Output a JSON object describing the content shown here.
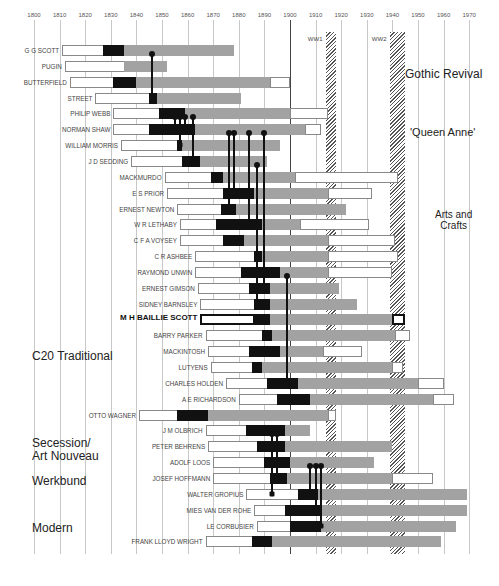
{
  "chart_data": {
    "type": "timeline-gantt",
    "title": "",
    "x_axis": {
      "label": "",
      "ticks": [
        1800,
        1810,
        1820,
        1830,
        1840,
        1850,
        1860,
        1870,
        1880,
        1890,
        1900,
        1910,
        1920,
        1930,
        1940,
        1950,
        1960,
        1970
      ],
      "range": [
        1800,
        1975
      ]
    },
    "legend": {
      "white": "early life / training",
      "black": "key formative period",
      "gray": "active career",
      "white_tail": "later life"
    },
    "wars": [
      {
        "label": "WW1",
        "start": 1914,
        "end": 1918
      },
      {
        "label": "WW2",
        "start": 1939,
        "end": 1945
      }
    ],
    "movements": [
      {
        "label": "Gothic Revival",
        "x": 405,
        "y": 68,
        "size": 12
      },
      {
        "label": "'Queen Anne'",
        "x": 410,
        "y": 126,
        "size": 11
      },
      {
        "label": "Arts and\nCrafts",
        "x": 435,
        "y": 209,
        "size": 10,
        "align": "center"
      },
      {
        "label": "C20 Traditional",
        "x": 32,
        "y": 350,
        "size": 12
      },
      {
        "label": "Secession/\nArt Nouveau",
        "x": 32,
        "y": 437,
        "size": 12
      },
      {
        "label": "Werkbund",
        "x": 32,
        "y": 475,
        "size": 12
      },
      {
        "label": "Modern",
        "x": 32,
        "y": 522,
        "size": 12
      }
    ],
    "architects": [
      {
        "name": "G G SCOTT",
        "segments": [
          1811,
          1827,
          1835,
          1878,
          null
        ]
      },
      {
        "name": "PUGIN",
        "segments": [
          1812,
          1835,
          1835,
          1852,
          null
        ]
      },
      {
        "name": "BUTTERFIELD",
        "segments": [
          1814,
          1831,
          1840,
          1892,
          1900
        ]
      },
      {
        "name": "STREET",
        "segments": [
          1824,
          1845,
          1848,
          1881,
          null
        ]
      },
      {
        "name": "PHILIP WEBB",
        "segments": [
          1831,
          1849,
          1859,
          1900,
          1915
        ]
      },
      {
        "name": "NORMAN SHAW",
        "segments": [
          1831,
          1845,
          1863,
          1906,
          1912
        ]
      },
      {
        "name": "WILLIAM MORRIS",
        "segments": [
          1834,
          1856,
          1858,
          1896,
          null
        ]
      },
      {
        "name": "J D SEDDING",
        "segments": [
          1838,
          1858,
          1865,
          1891,
          null
        ]
      },
      {
        "name": "MACKMURDO",
        "segments": [
          1851,
          1869,
          1874,
          1902,
          1942
        ]
      },
      {
        "name": "E S PRIOR",
        "segments": [
          1852,
          1874,
          1886,
          1915,
          1932
        ]
      },
      {
        "name": "ERNEST NEWTON",
        "segments": [
          1856,
          1873,
          1879,
          1922,
          null
        ]
      },
      {
        "name": "W R LETHABY",
        "segments": [
          1857,
          1871,
          1889,
          1904,
          1931
        ]
      },
      {
        "name": "C F A VOYSEY",
        "segments": [
          1857,
          1874,
          1882,
          1915,
          1941
        ]
      },
      {
        "name": "C R ASHBEE",
        "segments": [
          1863,
          1886,
          1889,
          1915,
          1942
        ]
      },
      {
        "name": "RAYMOND UNWIN",
        "segments": [
          1863,
          1881,
          1896,
          1915,
          1940
        ]
      },
      {
        "name": "ERNEST GIMSON",
        "segments": [
          1864,
          1884,
          1892,
          1919,
          null
        ]
      },
      {
        "name": "SIDNEY BARNSLEY",
        "segments": [
          1865,
          1886,
          1892,
          1926,
          null
        ]
      },
      {
        "name": "M H BAILLIE SCOTT",
        "segments": [
          1865,
          1886,
          1892,
          1940,
          1945
        ],
        "bold": true
      },
      {
        "name": "BARRY PARKER",
        "segments": [
          1867,
          1889,
          1893,
          1941,
          1947
        ]
      },
      {
        "name": "MACKINTOSH",
        "segments": [
          1868,
          1884,
          1896,
          1913,
          1928
        ]
      },
      {
        "name": "LUTYENS",
        "segments": [
          1869,
          1885,
          1889,
          1940,
          1944
        ]
      },
      {
        "name": "CHARLES HOLDEN",
        "segments": [
          1875,
          1891,
          1903,
          1950,
          1960
        ]
      },
      {
        "name": "A E RICHARDSON",
        "segments": [
          1880,
          1895,
          1908,
          1956,
          1964
        ]
      },
      {
        "name": "OTTO WAGNER",
        "segments": [
          1841,
          1856,
          1868,
          1915,
          1918
        ]
      },
      {
        "name": "J M OLBRICH",
        "segments": [
          1867,
          1883,
          1898,
          1908,
          null
        ]
      },
      {
        "name": "PETER BEHRENS",
        "segments": [
          1868,
          1887,
          1898,
          1940,
          null
        ]
      },
      {
        "name": "ADOLF LOOS",
        "segments": [
          1870,
          1890,
          1900,
          1933,
          null
        ]
      },
      {
        "name": "JOSEF HOFFMANN",
        "segments": [
          1870,
          1892,
          1899,
          1940,
          1956
        ]
      },
      {
        "name": "WALTER GROPIUS",
        "segments": [
          1883,
          1903,
          1911,
          1969,
          null
        ]
      },
      {
        "name": "MIES VAN DER ROHE",
        "segments": [
          1886,
          1898,
          1912,
          1969,
          null
        ]
      },
      {
        "name": "LE CORBUSIER",
        "segments": [
          1887,
          1900,
          1912,
          1965,
          null
        ]
      },
      {
        "name": "FRANK LLOYD WRIGHT",
        "segments": [
          1867,
          1885,
          1893,
          1959,
          null
        ]
      }
    ],
    "influence_links": [
      {
        "year": 1846,
        "from_row": 0,
        "to_row": 3
      },
      {
        "year": 1855,
        "from_row": 4,
        "to_row": 5
      },
      {
        "year": 1857,
        "from_row": 4,
        "to_row": 6
      },
      {
        "year": 1859,
        "from_row": 4,
        "to_row": 5
      },
      {
        "year": 1862,
        "from_row": 4,
        "to_row": 7
      },
      {
        "year": 1876,
        "from_row": 5,
        "to_row": 10
      },
      {
        "year": 1878,
        "from_row": 5,
        "to_row": 9
      },
      {
        "year": 1884,
        "from_row": 5,
        "to_row": 11
      },
      {
        "year": 1890,
        "from_row": 5,
        "to_row": 15
      },
      {
        "year": 1887,
        "from_row": 7,
        "to_row": 16
      },
      {
        "year": 1899,
        "from_row": 14,
        "to_row": 21
      },
      {
        "year": 1893,
        "from_row": 24,
        "to_row": 28
      },
      {
        "year": 1895,
        "from_row": 24,
        "to_row": 27
      },
      {
        "year": 1908,
        "from_row": 26,
        "to_row": 28
      },
      {
        "year": 1910,
        "from_row": 26,
        "to_row": 29
      },
      {
        "year": 1912,
        "from_row": 26,
        "to_row": 30
      }
    ]
  }
}
